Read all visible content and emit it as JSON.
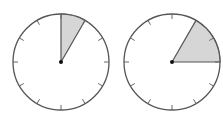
{
  "diagram": {
    "type": "clock-face-fraction",
    "colors": {
      "background": "#ffffff",
      "outline": "#555555",
      "tick": "#666666",
      "shade": "#d6d6d6",
      "center_dot": "#111111"
    },
    "clocks": [
      {
        "name": "left-clock",
        "cx": 61,
        "cy": 62,
        "r": 48,
        "ticks": 12,
        "shaded_from_hour": 0,
        "shaded_to_hour": 1,
        "shaded_fraction": "1/12"
      },
      {
        "name": "right-clock",
        "cx": 172,
        "cy": 62,
        "r": 48,
        "ticks": 12,
        "shaded_from_hour": 1,
        "shaded_to_hour": 3,
        "shaded_fraction": "2/12"
      }
    ]
  }
}
